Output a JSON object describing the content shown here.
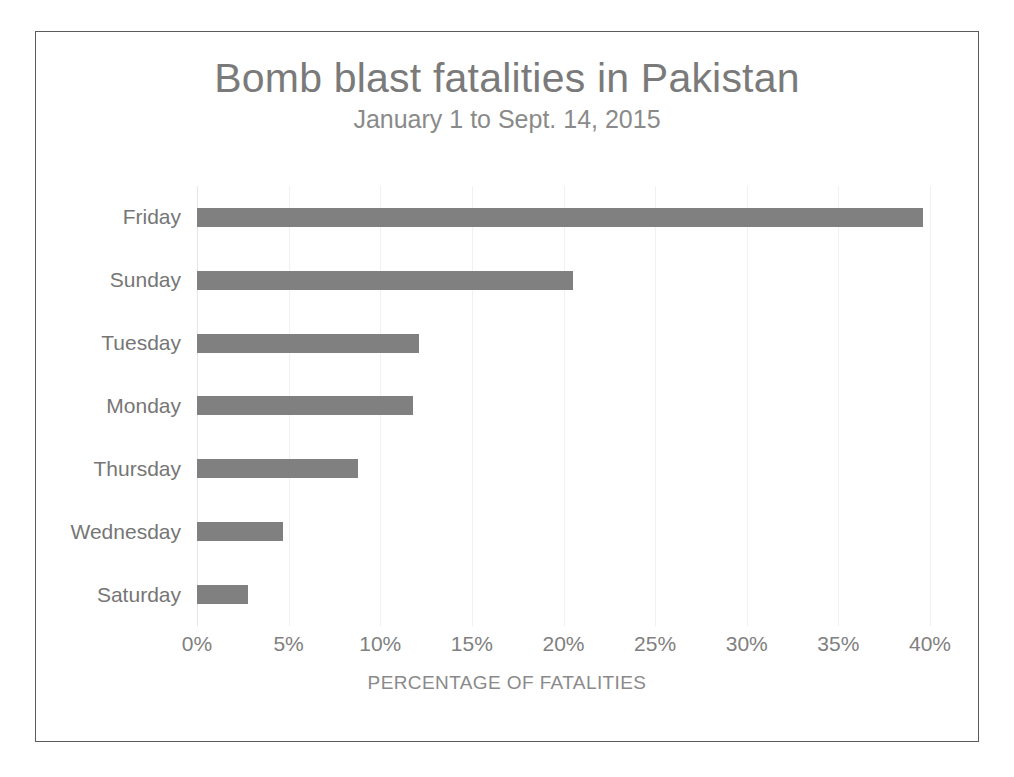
{
  "chart_data": {
    "type": "bar",
    "orientation": "horizontal",
    "title": "Bomb blast fatalities in Pakistan",
    "subtitle": "January 1 to Sept. 14, 2015",
    "xlabel": "PERCENTAGE OF FATALITIES",
    "ylabel": "",
    "categories": [
      "Friday",
      "Sunday",
      "Tuesday",
      "Monday",
      "Thursday",
      "Wednesday",
      "Saturday"
    ],
    "values": [
      39.6,
      20.5,
      12.1,
      11.8,
      8.8,
      4.7,
      2.8
    ],
    "value_unit": "%",
    "xlim": [
      0,
      40
    ],
    "xticks": [
      0,
      5,
      10,
      15,
      20,
      25,
      30,
      35,
      40
    ],
    "xtick_labels": [
      "0%",
      "5%",
      "10%",
      "15%",
      "20%",
      "25%",
      "30%",
      "35%",
      "40%"
    ],
    "grid": "vertical-only",
    "legend": "none",
    "bar_color": "#808080",
    "title_color": "#7a7a7a",
    "label_color": "#767676",
    "gridline_color": "#f1f1f1",
    "border_color": "#5b5b5b",
    "background": "#ffffff"
  }
}
